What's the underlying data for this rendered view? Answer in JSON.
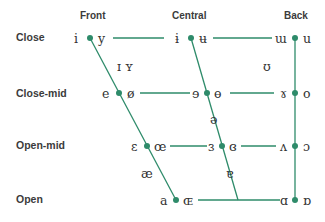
{
  "chart": {
    "accent_color": "#2e8b6a",
    "columns": [
      {
        "label": "Front"
      },
      {
        "label": "Central"
      },
      {
        "label": "Back"
      }
    ],
    "rows": [
      {
        "label": "Close"
      },
      {
        "label": "Close-mid"
      },
      {
        "label": "Open-mid"
      },
      {
        "label": "Open"
      }
    ],
    "vowels": {
      "close": {
        "front_unrounded": "i",
        "front_rounded": "y",
        "central_unrounded": "ɨ",
        "central_rounded": "ʉ",
        "back_unrounded": "ɯ",
        "back_rounded": "u"
      },
      "near_close": {
        "front_unrounded": "ɪ",
        "front_rounded": "ʏ",
        "back_rounded": "ʊ"
      },
      "close_mid": {
        "front_unrounded": "e",
        "front_rounded": "ø",
        "central_unrounded": "ɘ",
        "central_rounded": "ɵ",
        "back_unrounded": "ɤ",
        "back_rounded": "o"
      },
      "mid": {
        "central": "ə"
      },
      "open_mid": {
        "front_unrounded": "ɛ",
        "front_rounded": "œ",
        "central_unrounded": "ɜ",
        "central_rounded": "ɞ",
        "back_unrounded": "ʌ",
        "back_rounded": "ɔ"
      },
      "near_open": {
        "front": "æ",
        "central": "ɐ"
      },
      "open": {
        "front_unrounded": "a",
        "front_rounded": "ɶ",
        "back_unrounded": "ɑ",
        "back_rounded": "ɒ"
      }
    }
  }
}
